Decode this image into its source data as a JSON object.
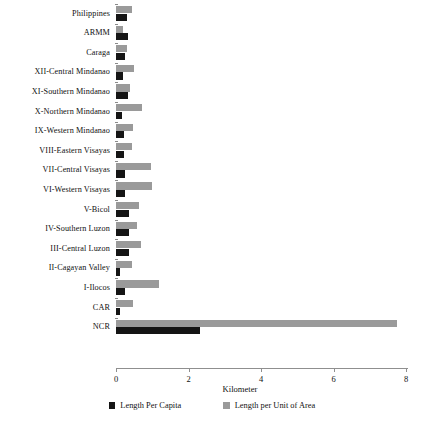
{
  "chart_data": {
    "type": "bar",
    "orientation": "horizontal",
    "title": "",
    "xlabel": "Kilometer",
    "ylabel": "",
    "xlim": [
      0,
      8
    ],
    "xticks": [
      0,
      2,
      4,
      6,
      8
    ],
    "xtick_labels": [
      "0",
      "2",
      "4",
      "6",
      "8"
    ],
    "grid": false,
    "legend_position": "bottom",
    "categories": [
      "Philippines",
      "ARMM",
      "Caraga",
      "XII-Central Mindanao",
      "XI-Southern Mindanao",
      "X-Northern Mindanao",
      "IX-Western Mindanao",
      "VIII-Eastern Visayas",
      "VII-Central Visayas",
      "VI-Western Visayas",
      "V-Bicol",
      "IV-Southern Luzon",
      "III-Central Luzon",
      "II-Cagayan Valley",
      "I-Ilocos",
      "CAR",
      "NCR"
    ],
    "series": [
      {
        "name": "Length Per Capita",
        "color": "#151515",
        "values": [
          0.3,
          0.33,
          0.26,
          0.2,
          0.32,
          0.17,
          0.23,
          0.22,
          0.26,
          0.25,
          0.35,
          0.36,
          0.37,
          0.12,
          0.24,
          0.11,
          2.32
        ]
      },
      {
        "name": "Length per Unit of Area",
        "color": "#9a9a9a",
        "values": [
          0.43,
          0.2,
          0.31,
          0.5,
          0.38,
          0.72,
          0.48,
          0.44,
          0.97,
          0.98,
          0.63,
          0.59,
          0.7,
          0.44,
          1.18,
          0.46,
          7.75
        ]
      }
    ]
  },
  "axis": {
    "xlabel": "Kilometer"
  },
  "legend": {
    "items": [
      {
        "label": "Length Per Capita",
        "swatch": "capita-swatch"
      },
      {
        "label": "Length per Unit of Area",
        "swatch": "area-swatch"
      }
    ]
  }
}
